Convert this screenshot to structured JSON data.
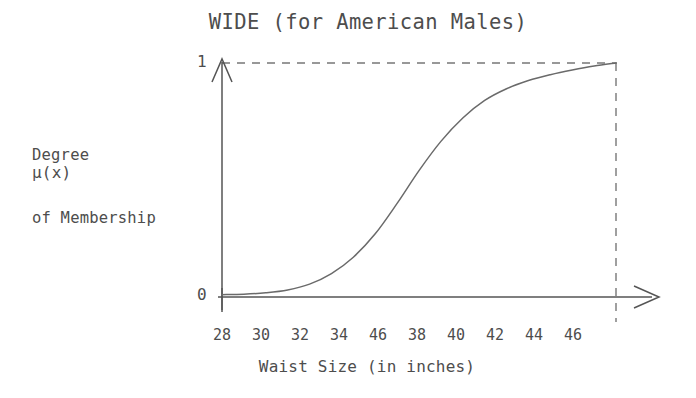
{
  "chart_data": {
    "type": "line",
    "title": "WIDE (for American Males)",
    "subtitle": "",
    "xlabel": "Waist Size (in inches)",
    "ylabel": "Degree of Membership",
    "ylabel_symbol": "μ(x)",
    "ylabel_lines": [
      "Degree",
      "of Membership"
    ],
    "grid": false,
    "legend": "none",
    "xlim": [
      28,
      46
    ],
    "ylim": [
      0,
      1
    ],
    "ytick_labels": [
      "0",
      "1"
    ],
    "ytick_values": [
      0,
      1
    ],
    "xtick_labels": [
      "28",
      "30",
      "32",
      "34",
      "46",
      "38",
      "40",
      "42",
      "44",
      "46"
    ],
    "xtick_values": [
      28,
      30,
      32,
      34,
      36,
      38,
      40,
      42,
      44,
      46
    ],
    "series": [
      {
        "name": "WIDE membership",
        "x": [
          28,
          29,
          30,
          31,
          32,
          33,
          34,
          35,
          36,
          37,
          38,
          39,
          40,
          41,
          42,
          43,
          44,
          45,
          46
        ],
        "values": [
          0.01,
          0.012,
          0.018,
          0.03,
          0.055,
          0.1,
          0.17,
          0.27,
          0.4,
          0.54,
          0.665,
          0.765,
          0.84,
          0.89,
          0.925,
          0.95,
          0.97,
          0.987,
          1.0
        ]
      }
    ],
    "annotations": [
      {
        "name": "upper-bound-dashed-line",
        "orientation": "horizontal",
        "value": 1
      },
      {
        "name": "right-bound-dashed-line",
        "orientation": "vertical",
        "value": 46
      }
    ],
    "colors": {
      "background": "#ffffff",
      "axis": "#555555",
      "curve": "#6a6a6a",
      "dashed": "#777777",
      "text": "#4d4d4d"
    }
  },
  "geometry": {
    "x_axis_y": 297,
    "y_axis_x": 222,
    "plot_right_x": 616,
    "plot_top_y": 63,
    "x_tick_positions": [
      222,
      261,
      300,
      339,
      378,
      417,
      456,
      495,
      534,
      573
    ]
  }
}
